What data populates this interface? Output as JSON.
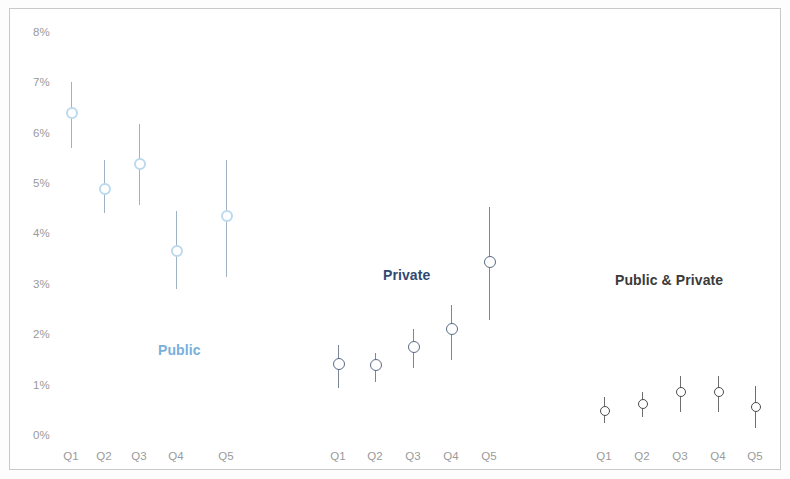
{
  "chart_data": {
    "type": "scatter",
    "title": "",
    "subtitle": "",
    "xlabel": "",
    "ylabel": "",
    "ylim": [
      0,
      8
    ],
    "y_tick_labels": [
      "0%",
      "1%",
      "2%",
      "3%",
      "4%",
      "5%",
      "6%",
      "7%",
      "8%"
    ],
    "y_tick_values": [
      0,
      1,
      2,
      3,
      4,
      5,
      6,
      7,
      8
    ],
    "grid": false,
    "legend_position": "inline-annotations",
    "value_unit": "%",
    "categories": [
      "Q1",
      "Q2",
      "Q3",
      "Q4",
      "Q5"
    ],
    "series": [
      {
        "name": "Public",
        "color": "#bcd9ee",
        "label_color": "#7aafdb",
        "whisker_color": "#9fb2c4",
        "label_x": 158,
        "label_y": 342,
        "values": [
          6.41,
          4.9,
          5.4,
          3.67,
          4.37
        ],
        "ci_low": [
          5.71,
          4.43,
          4.58,
          2.92,
          3.15
        ],
        "ci_high": [
          7.02,
          5.48,
          6.19,
          4.46,
          5.48
        ],
        "points": [
          {
            "category": "Q1",
            "value": 6.41,
            "low": 5.71,
            "high": 7.02
          },
          {
            "category": "Q2",
            "value": 4.9,
            "low": 4.43,
            "high": 5.48
          },
          {
            "category": "Q3",
            "value": 5.4,
            "low": 4.58,
            "high": 6.19
          },
          {
            "category": "Q4",
            "value": 3.67,
            "low": 2.92,
            "high": 4.46
          },
          {
            "category": "Q5",
            "value": 4.37,
            "low": 3.15,
            "high": 5.48
          }
        ]
      },
      {
        "name": "Private",
        "color": "#5a6b85",
        "label_color": "#2f4a72",
        "whisker_color": "#7b8799",
        "label_x": 383,
        "label_y": 267,
        "values": [
          1.43,
          1.41,
          1.77,
          2.12,
          3.45
        ],
        "ci_low": [
          0.95,
          1.07,
          1.35,
          1.51,
          2.3
        ],
        "ci_high": [
          1.81,
          1.65,
          2.12,
          2.6,
          4.54
        ],
        "points": [
          {
            "category": "Q1",
            "value": 1.43,
            "low": 0.95,
            "high": 1.81
          },
          {
            "category": "Q2",
            "value": 1.41,
            "low": 1.07,
            "high": 1.65
          },
          {
            "category": "Q3",
            "value": 1.77,
            "low": 1.35,
            "high": 2.12
          },
          {
            "category": "Q4",
            "value": 2.12,
            "low": 1.51,
            "high": 2.6
          },
          {
            "category": "Q5",
            "value": 3.45,
            "low": 2.3,
            "high": 4.54
          }
        ]
      },
      {
        "name": "Public & Private",
        "color": "#4a4a4a",
        "label_color": "#3a3a3a",
        "whisker_color": "#6e6e6e",
        "label_x": 615,
        "label_y": 272,
        "values": [
          0.5,
          0.63,
          0.87,
          0.87,
          0.58
        ],
        "ci_low": [
          0.26,
          0.38,
          0.48,
          0.48,
          0.16
        ],
        "ci_high": [
          0.77,
          0.87,
          1.19,
          1.19,
          0.99
        ],
        "points": [
          {
            "category": "Q1",
            "value": 0.5,
            "low": 0.26,
            "high": 0.77
          },
          {
            "category": "Q2",
            "value": 0.63,
            "low": 0.38,
            "high": 0.87
          },
          {
            "category": "Q3",
            "value": 0.87,
            "low": 0.48,
            "high": 1.19
          },
          {
            "category": "Q4",
            "value": 0.87,
            "low": 0.48,
            "high": 1.19
          },
          {
            "category": "Q5",
            "value": 0.58,
            "low": 0.16,
            "high": 0.99
          }
        ]
      }
    ]
  },
  "axis": {
    "y_labels": [
      "8%",
      "7%",
      "6%",
      "5%",
      "4%",
      "3%",
      "2%",
      "1%",
      "0%"
    ],
    "x_group_labels": [
      {
        "group": "Public",
        "ticks": [
          "Q1",
          "Q2",
          "Q3",
          "Q4",
          "Q5"
        ]
      },
      {
        "group": "Private",
        "ticks": [
          "Q1",
          "Q2",
          "Q3",
          "Q4",
          "Q5"
        ]
      },
      {
        "group": "Public & Private",
        "ticks": [
          "Q1",
          "Q2",
          "Q3",
          "Q4",
          "Q5"
        ]
      }
    ]
  },
  "layout": {
    "y_zero_px": 436,
    "px_per_percent": 50.4,
    "x_positions": {
      "Public": [
        71,
        104,
        139,
        176,
        226
      ],
      "Private": [
        338,
        375,
        413,
        451,
        489
      ],
      "Public & Private": [
        604,
        642,
        680,
        718,
        755
      ]
    },
    "tick_label_y": 450
  }
}
